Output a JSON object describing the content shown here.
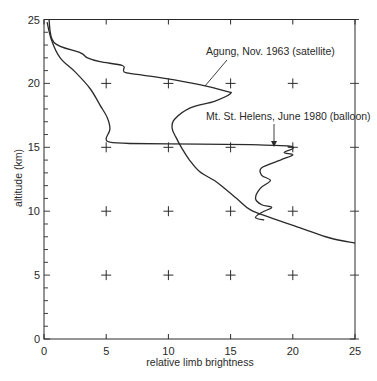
{
  "chart_data": {
    "type": "line",
    "title": "",
    "xlabel": "relative limb brightness",
    "ylabel": "altitude (km)",
    "xlim": [
      0,
      25
    ],
    "ylim": [
      0,
      25
    ],
    "x_ticks": [
      0,
      5,
      10,
      15,
      20,
      25
    ],
    "y_ticks": [
      0,
      5,
      10,
      15,
      20,
      25
    ],
    "x_tick_labels": [
      "0",
      "5",
      "10",
      "15",
      "20",
      "25"
    ],
    "y_tick_labels": [
      "0",
      "5",
      "10",
      "15",
      "20",
      "25"
    ],
    "y_minor_tick_step": 1,
    "grid": "cross markers at major tick intersections",
    "legend": "none (curves labeled by annotations with arrows)",
    "series": [
      {
        "name": "Agung, Nov. 1963 (satellite)",
        "points": [
          [
            0.4,
            25.0
          ],
          [
            0.8,
            23.2
          ],
          [
            2.9,
            22.4
          ],
          [
            3.5,
            22.0
          ],
          [
            4.5,
            21.7
          ],
          [
            6.3,
            21.4
          ],
          [
            6.4,
            21.0
          ],
          [
            6.8,
            20.8
          ],
          [
            9.7,
            20.4
          ],
          [
            12.5,
            19.9
          ],
          [
            14.6,
            19.4
          ],
          [
            15.0,
            19.2
          ],
          [
            13.7,
            18.6
          ],
          [
            11.8,
            18.1
          ],
          [
            10.5,
            17.2
          ],
          [
            10.3,
            16.5
          ],
          [
            10.6,
            15.8
          ],
          [
            11.1,
            14.9
          ],
          [
            11.7,
            14.0
          ],
          [
            12.5,
            13.1
          ],
          [
            13.7,
            12.4
          ],
          [
            14.5,
            11.8
          ],
          [
            15.6,
            10.9
          ],
          [
            16.6,
            10.1
          ],
          [
            18.2,
            9.5
          ],
          [
            20.6,
            8.7
          ],
          [
            23.0,
            7.9
          ],
          [
            25.0,
            7.5
          ]
        ]
      },
      {
        "name": "Mt. St. Helens, June 1980 (balloon)",
        "points": [
          [
            0.25,
            24.8
          ],
          [
            0.6,
            23.4
          ],
          [
            1.3,
            22.0
          ],
          [
            2.5,
            20.9
          ],
          [
            3.7,
            19.6
          ],
          [
            4.5,
            18.3
          ],
          [
            5.1,
            17.3
          ],
          [
            5.3,
            16.4
          ],
          [
            5.0,
            15.7
          ],
          [
            5.3,
            15.4
          ],
          [
            6.9,
            15.3
          ],
          [
            12.5,
            15.25
          ],
          [
            16.6,
            15.2
          ],
          [
            19.6,
            15.1
          ],
          [
            20.0,
            14.9
          ],
          [
            19.3,
            14.6
          ],
          [
            20.0,
            14.4
          ],
          [
            19.0,
            14.0
          ],
          [
            17.5,
            13.4
          ],
          [
            17.5,
            12.8
          ],
          [
            18.2,
            12.4
          ],
          [
            17.4,
            11.8
          ],
          [
            17.0,
            11.0
          ],
          [
            17.5,
            10.5
          ],
          [
            18.3,
            10.3
          ],
          [
            17.5,
            9.9
          ],
          [
            17.0,
            9.5
          ],
          [
            17.7,
            9.3
          ]
        ]
      }
    ],
    "annotations": [
      {
        "text": "Agung, Nov. 1963 (satellite)",
        "arrow_to": [
          12.0,
          19.7
        ]
      },
      {
        "text": "Mt. St. Helens, June 1980 (balloon)",
        "arrow_to": [
          18.5,
          15.1
        ]
      }
    ]
  },
  "labels": {
    "xlabel": "relative limb brightness",
    "ylabel": "altitude (km)",
    "annotation_agung": "Agung, Nov. 1963 (satellite)",
    "annotation_sthelens": "Mt. St. Helens, June 1980 (balloon)"
  },
  "colors": {
    "line": "#2a2a2a",
    "background": "#ffffff"
  }
}
